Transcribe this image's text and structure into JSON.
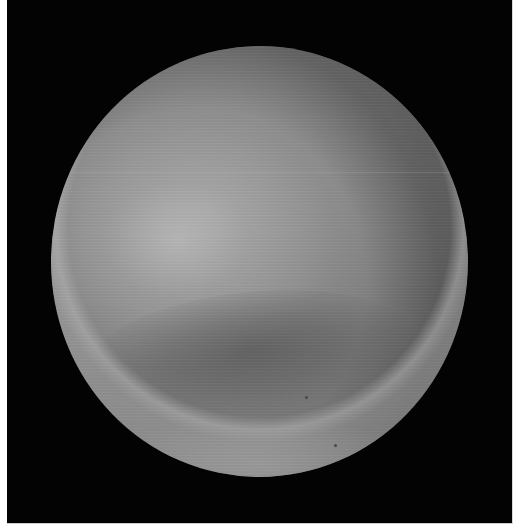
{
  "image": {
    "subject": "planet",
    "description": "Monochrome photograph of a planetary disc against a black sky",
    "style": "grayscale",
    "colors": {
      "background_frame": "#030303",
      "page_margin": "#ffffff",
      "disc_highlight": "#c8c8c8",
      "disc_mid": "#8c8c8c",
      "disc_dark_band": "#5a5a5a",
      "limb_bright": "#b4b4b4"
    },
    "features": [
      {
        "name": "highlight",
        "position": "upper-left"
      },
      {
        "name": "dark-band",
        "position": "lower-middle"
      },
      {
        "name": "bright-limb-crescent",
        "position": "bottom"
      },
      {
        "name": "scan-line",
        "position": "horizontal, upper third"
      }
    ]
  }
}
